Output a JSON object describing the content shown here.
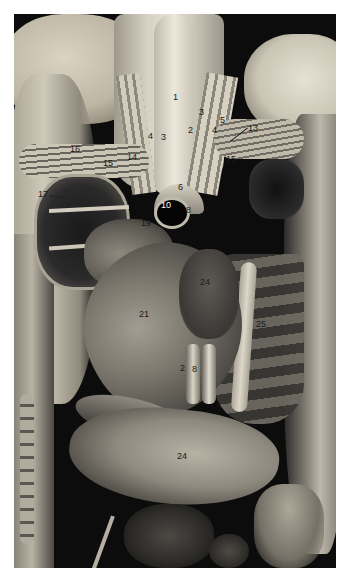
{
  "figure": {
    "labels": [
      {
        "id": "l1",
        "text": "1",
        "x": 173,
        "y": 93,
        "tone": "dark"
      },
      {
        "id": "l2",
        "text": "2",
        "x": 188,
        "y": 126,
        "tone": "dark"
      },
      {
        "id": "l3a",
        "text": "3",
        "x": 199,
        "y": 108,
        "tone": "dark"
      },
      {
        "id": "l3b",
        "text": "3",
        "x": 161,
        "y": 133,
        "tone": "dark"
      },
      {
        "id": "l4a",
        "text": "4",
        "x": 148,
        "y": 132,
        "tone": "dark"
      },
      {
        "id": "l4b",
        "text": "4",
        "x": 212,
        "y": 126,
        "tone": "dark"
      },
      {
        "id": "l5",
        "text": "5",
        "x": 220,
        "y": 116,
        "tone": "dark"
      },
      {
        "id": "l6",
        "text": "6",
        "x": 178,
        "y": 183,
        "tone": "dark"
      },
      {
        "id": "l8a",
        "text": "8",
        "x": 186,
        "y": 206,
        "tone": "dark"
      },
      {
        "id": "l8b",
        "text": "8",
        "x": 192,
        "y": 365,
        "tone": "dark"
      },
      {
        "id": "l2b",
        "text": "2",
        "x": 180,
        "y": 364,
        "tone": "dark"
      },
      {
        "id": "l10",
        "text": "10",
        "x": 161,
        "y": 201,
        "tone": "light"
      },
      {
        "id": "l13",
        "text": "13",
        "x": 248,
        "y": 124,
        "tone": "dark"
      },
      {
        "id": "l14",
        "text": "14",
        "x": 127,
        "y": 153,
        "tone": "dark"
      },
      {
        "id": "l15a",
        "text": "15",
        "x": 103,
        "y": 159,
        "tone": "dark"
      },
      {
        "id": "l15b",
        "text": "15",
        "x": 226,
        "y": 155,
        "tone": "dark"
      },
      {
        "id": "l16",
        "text": "16",
        "x": 70,
        "y": 145,
        "tone": "dark"
      },
      {
        "id": "l17",
        "text": "17",
        "x": 38,
        "y": 190,
        "tone": "dark"
      },
      {
        "id": "l18",
        "text": "18",
        "x": 82,
        "y": 222,
        "tone": "dark"
      },
      {
        "id": "l19",
        "text": "19",
        "x": 141,
        "y": 219,
        "tone": "dark"
      },
      {
        "id": "l21",
        "text": "21",
        "x": 139,
        "y": 310,
        "tone": "dark"
      },
      {
        "id": "l24",
        "text": "24",
        "x": 200,
        "y": 278,
        "tone": "dark"
      },
      {
        "id": "l24b",
        "text": "24",
        "x": 177,
        "y": 452,
        "tone": "dark"
      },
      {
        "id": "l25",
        "text": "25",
        "x": 256,
        "y": 320,
        "tone": "dark"
      }
    ]
  }
}
